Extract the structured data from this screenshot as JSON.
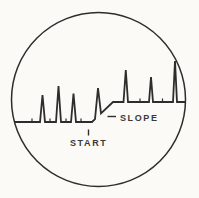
{
  "figure": {
    "title_semantic": "oscilloscope-screen-pulse-train",
    "slope_label": "SLOPE",
    "start_label": "START",
    "ink_color": "#2e2d2b",
    "text_color": "#3a3938",
    "paper_color": "#fbfaf7",
    "circle": {
      "cx": 98.5,
      "cy": 99.5,
      "r": 87
    },
    "trace_points": [
      [
        14.5,
        122
      ],
      [
        40,
        122
      ],
      [
        42.5,
        95
      ],
      [
        45,
        122
      ],
      [
        56,
        122
      ],
      [
        58.5,
        86
      ],
      [
        61,
        122
      ],
      [
        71,
        122
      ],
      [
        73.5,
        93.5
      ],
      [
        76,
        122
      ],
      [
        92,
        122
      ],
      [
        95,
        119.1
      ],
      [
        98,
        88
      ],
      [
        101,
        113.4
      ],
      [
        113,
        102
      ],
      [
        123.5,
        102
      ],
      [
        125.8,
        70
      ],
      [
        128,
        102
      ],
      [
        149,
        102
      ],
      [
        151,
        77
      ],
      [
        153,
        102
      ],
      [
        173,
        102
      ],
      [
        175,
        61
      ],
      [
        177,
        102
      ],
      [
        185.5,
        102
      ]
    ],
    "baseline_ticks": [
      {
        "x": 32,
        "y1": 122,
        "y2": 118.5
      },
      {
        "x": 50,
        "y1": 122,
        "y2": 118.5
      },
      {
        "x": 66,
        "y1": 122,
        "y2": 118.5
      },
      {
        "x": 81,
        "y1": 122,
        "y2": 118.5
      },
      {
        "x": 140,
        "y1": 102,
        "y2": 98.5
      },
      {
        "x": 162.5,
        "y1": 102,
        "y2": 98.5
      }
    ],
    "start_pointer": {
      "x": 88.5,
      "y1": 129.5,
      "y2": 135.5
    },
    "slope_pointer": {
      "x1": 107.5,
      "y1": 116.5,
      "x2": 116,
      "y2": 116.5
    },
    "slope_label_pos": {
      "x": 120,
      "y": 120.5
    },
    "start_label_pos": {
      "x": 70,
      "y": 145.5
    },
    "stroke_widths": {
      "circle": 1.5,
      "trace": 1.8,
      "tick": 1.2,
      "pointer": 1.4
    }
  }
}
